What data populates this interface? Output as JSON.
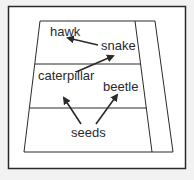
{
  "diagram": {
    "type": "food-pyramid",
    "levels": [
      {
        "index": 0,
        "organisms": [
          "hawk",
          "snake"
        ]
      },
      {
        "index": 1,
        "organisms": [
          "caterpillar",
          "beetle"
        ]
      },
      {
        "index": 2,
        "organisms": [
          "seeds"
        ]
      }
    ],
    "labels": {
      "hawk": "hawk",
      "snake": "snake",
      "caterpillar": "caterpillar",
      "beetle": "beetle",
      "seeds": "seeds"
    },
    "arrows": [
      {
        "from": "snake",
        "to": "hawk"
      },
      {
        "from": "caterpillar",
        "to": "snake"
      },
      {
        "from": "seeds",
        "to": "caterpillar"
      },
      {
        "from": "seeds",
        "to": "beetle"
      }
    ],
    "colors": {
      "background": "#f2f2f2",
      "panel": "#ffffff",
      "line": "#2a2a2a",
      "text": "#2a2a2a"
    }
  }
}
